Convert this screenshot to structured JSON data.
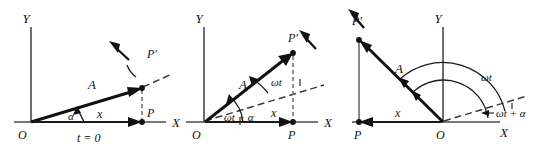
{
  "figure": {
    "background_color": "#ffffff",
    "ink_color": "#111111",
    "axis_color": "#4a4a4a"
  },
  "panels": [
    {
      "id": "panel-1",
      "caption": "t = 0",
      "axis_y_label": "Y",
      "axis_x_label": "X",
      "origin_label": "O",
      "vector_label": "A",
      "tip_label": "P'",
      "foot_label": "P",
      "projection_label": "x",
      "angle_label": "α",
      "description": "Vector A at initial phase angle alpha above the X axis; P is the projection of P' on X."
    },
    {
      "id": "panel-2",
      "caption": "",
      "axis_y_label": "Y",
      "axis_x_label": "X",
      "origin_label": "O",
      "vector_label": "A",
      "tip_label": "P'",
      "foot_label": "P",
      "projection_label": "x",
      "angle_label_outer": "ωt",
      "angle_label_inner": "ωt + α",
      "description": "Vector A rotated by omega t from the initial dashed position; total angle from X axis is omega t plus alpha."
    },
    {
      "id": "panel-3",
      "caption": "",
      "axis_y_label": "Y",
      "axis_x_label": "X",
      "origin_label": "O",
      "vector_label": "A",
      "tip_label": "P'",
      "foot_label": "P",
      "projection_label": "x",
      "angle_label_outer": "ωt",
      "angle_label_inner": "ωt + α",
      "description": "Vector A rotated into the second quadrant; projection x is now negative, measured left of the origin."
    }
  ]
}
